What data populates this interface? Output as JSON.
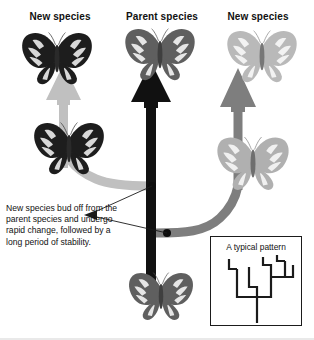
{
  "diagram": {
    "title_columns": [
      {
        "id": "left",
        "label": "New species"
      },
      {
        "id": "mid",
        "label": "Parent species"
      },
      {
        "id": "right",
        "label": "New species"
      }
    ],
    "caption": "New species bud off from the parent species and undergo rapid change, followed by a long period of stability.",
    "inset": {
      "title": "A typical pattern",
      "description": "branching evolutionary tree with repeated bifurcations"
    },
    "butterflies": [
      {
        "id": "new-species-left-top",
        "tone": "dark",
        "color": "#1d1d1d",
        "x": 18,
        "y": 28,
        "w": 78,
        "h": 58
      },
      {
        "id": "new-species-left-bottom",
        "tone": "dark",
        "color": "#1d1d1d",
        "x": 30,
        "y": 118,
        "w": 78,
        "h": 58
      },
      {
        "id": "parent-species-top",
        "tone": "medium",
        "color": "#5f5f5f",
        "x": 122,
        "y": 24,
        "w": 76,
        "h": 58
      },
      {
        "id": "parent-species-bottom",
        "tone": "medium",
        "color": "#5f5f5f",
        "x": 126,
        "y": 268,
        "w": 70,
        "h": 54
      },
      {
        "id": "new-species-right-top",
        "tone": "light",
        "color": "#b9b9b9",
        "x": 224,
        "y": 26,
        "w": 76,
        "h": 58
      },
      {
        "id": "new-species-right-bottom",
        "tone": "light",
        "color": "#b0b0b0",
        "x": 214,
        "y": 132,
        "w": 78,
        "h": 60
      }
    ],
    "arrows": [
      {
        "id": "trunk-arrow-parent",
        "direction": "up",
        "color": "#111111",
        "label": "parent species lineage"
      },
      {
        "id": "branch-arrow-left",
        "direction": "up",
        "color": "#c0c0c0",
        "label": "left new species lineage"
      },
      {
        "id": "branch-arrow-right",
        "direction": "up",
        "color": "#7e7e7e",
        "label": "right new species lineage"
      },
      {
        "id": "branch-curve-left",
        "direction": "left",
        "color": "#c0c0c0",
        "label": "budding off to the left"
      },
      {
        "id": "branch-curve-right",
        "direction": "right",
        "color": "#7e7e7e",
        "label": "budding off to the right"
      }
    ],
    "branch_points": [
      {
        "id": "branch-point-left",
        "x": 152,
        "y": 186
      },
      {
        "id": "branch-point-right",
        "x": 167,
        "y": 233
      }
    ],
    "colors": {
      "ink": "#111111",
      "trunk": "#111111",
      "light_branch": "#c0c0c0",
      "mid_branch": "#7e7e7e",
      "inset_border": "#1b1b1b",
      "background": "#ffffff"
    }
  }
}
